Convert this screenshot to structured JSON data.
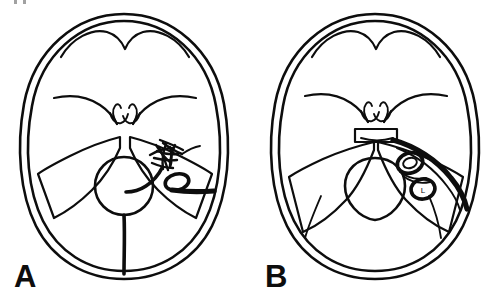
{
  "figure": {
    "type": "medical-line-drawing",
    "orientation": "axial",
    "background_color": "#ffffff",
    "ink_color": "#0d0d0d",
    "panel_count": 2
  },
  "panels": [
    {
      "id": "A",
      "label": "A",
      "side": "left",
      "description": "Axial skull base schematic with vascular malformation nidus in right middle fossa",
      "structures": [
        "skull-outer-table",
        "skull-inner-table",
        "frontal-lobe-outline",
        "sphenoid-wing-left",
        "sphenoid-wing-right",
        "tentorium-left",
        "tentorium-right",
        "brainstem-circle",
        "midline-falx-line",
        "nidus-tangle",
        "vessel-loop",
        "draining-vein"
      ]
    },
    {
      "id": "B",
      "label": "B",
      "side": "right",
      "description": "Axial skull base schematic with sella turcica block and two round vessel cross-sections in right tentorial incisura",
      "structures": [
        "skull-outer-table",
        "skull-inner-table",
        "frontal-lobe-outline",
        "sphenoid-wing-left",
        "sphenoid-wing-right",
        "sella-block",
        "tentorium-left",
        "tentorium-right",
        "brainstem-oval",
        "vessel-superior",
        "vessel-inferior",
        "thick-vessel-curve"
      ],
      "vessel_markers": [
        {
          "name": "vessel-superior",
          "tag": "",
          "cx": 239,
          "cy": 170
        },
        {
          "name": "vessel-inferior",
          "tag": "L",
          "cx": 255,
          "cy": 196
        }
      ]
    }
  ],
  "crop_marks": {
    "visible": true,
    "count": 2,
    "position": "top-left"
  }
}
